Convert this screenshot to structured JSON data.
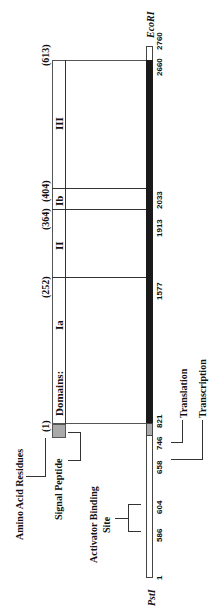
{
  "title_amino": "Amino Acid Residues",
  "residues": [
    "(1)",
    "(252)",
    "(364)",
    "(404)",
    "(613)"
  ],
  "domains_label": "Domains:",
  "domains": [
    "Ia",
    "II",
    "Ib",
    "III"
  ],
  "signal_peptide": "Signal Peptide",
  "activator": [
    "Activator Binding",
    "Site"
  ],
  "translation": "Translation",
  "transcription": "Transcription",
  "positions": [
    "1",
    "586",
    "604",
    "658",
    "746",
    "821",
    "1577",
    "1913",
    "2033",
    "2660",
    "2760"
  ],
  "pst": "PstI",
  "eco": "EcoRI",
  "colors": {
    "coding": "#1a1a1a",
    "signal": "#aaaaaa",
    "noncoding": "#ffffff"
  }
}
